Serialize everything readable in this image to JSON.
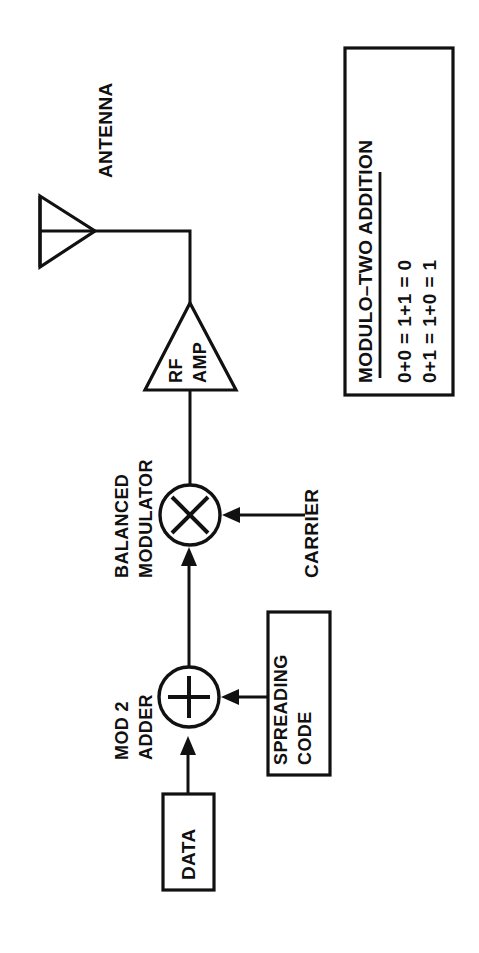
{
  "diagram": {
    "orientation": "rotated-90-ccw",
    "line_color": "#111111",
    "background_color": "#ffffff",
    "blocks": {
      "antenna": {
        "label": "ANTENNA",
        "shape": "triangle-antenna"
      },
      "rf_amp": {
        "label_line1": "RF",
        "label_line2": "AMP",
        "shape": "triangle-amplifier"
      },
      "balanced_modulator": {
        "label_line1": "BALANCED",
        "label_line2": "MODULATOR",
        "symbol": "×",
        "shape": "circle-multiplier"
      },
      "mod2_adder": {
        "label_line1": "MOD 2",
        "label_line2": "ADDER",
        "symbol": "+",
        "shape": "circle-summer"
      },
      "carrier": {
        "label": "CARRIER",
        "shape": "text-source"
      },
      "spreading_code": {
        "label_line1": "SPREADING",
        "label_line2": "CODE",
        "shape": "rectangle"
      },
      "data": {
        "label": "DATA",
        "shape": "rectangle"
      }
    },
    "legend": {
      "heading": "MODULO–TWO ADDITION",
      "rows": [
        "0+0 = 1+1 = 0",
        "0+1 = 1+0 = 1"
      ]
    }
  }
}
